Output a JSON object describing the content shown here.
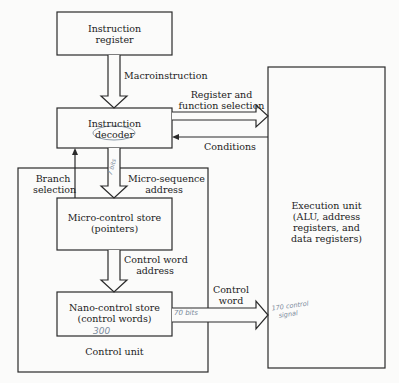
{
  "diagram": {
    "type": "block-diagram",
    "boxes": {
      "instruction_register": [
        "Instruction",
        "register"
      ],
      "instruction_decoder": [
        "Instruction",
        "decoder"
      ],
      "micro_control_store": [
        "Micro-control store",
        "(pointers)"
      ],
      "nano_control_store": [
        "Nano-control store",
        "(control words)"
      ],
      "execution_unit": [
        "Execution unit",
        "(ALU, address",
        "registers, and",
        "data registers)"
      ],
      "control_unit": "Control unit"
    },
    "arrows": {
      "macroinstruction": "Macroinstruction",
      "register_function": [
        "Register and",
        "function selection"
      ],
      "conditions": "Conditions",
      "branch_selection": [
        "Branch",
        "selection"
      ],
      "micro_sequence": [
        "Micro-sequence",
        "address"
      ],
      "control_word_address": [
        "Control word",
        "address"
      ],
      "control_word": [
        "Control",
        "word"
      ]
    },
    "handwritten": {
      "micro_sequence_bits": "7 bits",
      "nano_count": "300",
      "control_word_bits": "70 bits",
      "control_signals": [
        "170 control",
        "signal"
      ]
    },
    "colors": {
      "line": "#2a2a2a",
      "pencil": "#7a8a9a"
    }
  }
}
